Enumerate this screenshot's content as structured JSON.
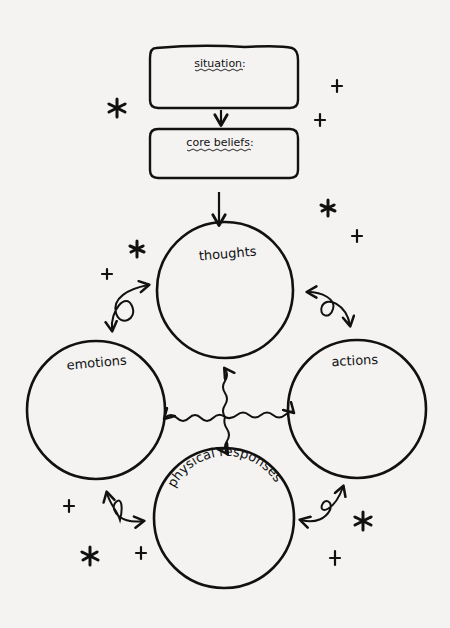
{
  "diagram": {
    "type": "cbt-cycle-worksheet",
    "colors": {
      "paper": "#f4f3f1",
      "ink": "#111111"
    },
    "boxes": [
      {
        "id": "situation",
        "label": "situation:"
      },
      {
        "id": "core_beliefs",
        "label": "core beliefs:"
      }
    ],
    "circles": [
      {
        "id": "thoughts",
        "label": "thoughts"
      },
      {
        "id": "emotions",
        "label": "emotions"
      },
      {
        "id": "actions",
        "label": "actions"
      },
      {
        "id": "physical_responses",
        "label": "physical responses"
      }
    ],
    "connections": [
      {
        "from": "situation",
        "to": "core_beliefs",
        "style": "straight-arrow"
      },
      {
        "from": "core_beliefs",
        "to": "thoughts",
        "style": "straight-arrow"
      },
      {
        "from": "thoughts",
        "to": "emotions",
        "style": "looped-double-arrow"
      },
      {
        "from": "thoughts",
        "to": "actions",
        "style": "looped-double-arrow"
      },
      {
        "from": "emotions",
        "to": "physical_responses",
        "style": "looped-double-arrow"
      },
      {
        "from": "actions",
        "to": "physical_responses",
        "style": "looped-double-arrow"
      },
      {
        "from": "center",
        "to": [
          "thoughts",
          "emotions",
          "actions",
          "physical_responses"
        ],
        "style": "wavy-four-way-arrow"
      }
    ],
    "decorations": {
      "stars": 5,
      "plus_signs": 7
    }
  }
}
